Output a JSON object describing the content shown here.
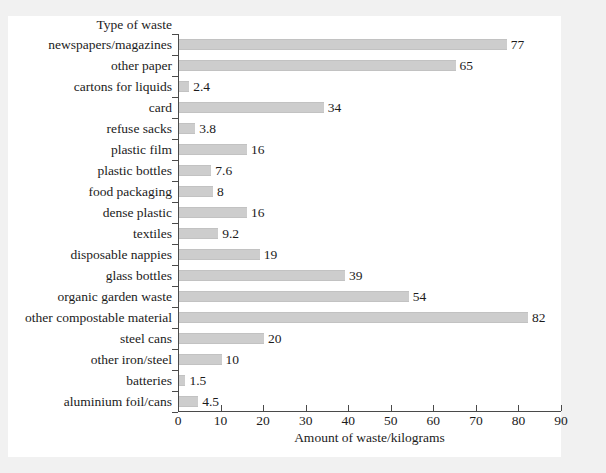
{
  "chart_data": {
    "type": "bar",
    "orientation": "horizontal",
    "title": "",
    "xlabel": "Amount of waste/kilograms",
    "ylabel": "Type of waste",
    "xlim": [
      0,
      90
    ],
    "xticks": [
      0,
      10,
      20,
      30,
      40,
      50,
      60,
      70,
      80,
      90
    ],
    "grid": false,
    "legend": null,
    "bar_color": "#cdcdcd",
    "categories": [
      "newspapers/magazines",
      "other paper",
      "cartons for liquids",
      "card",
      "refuse sacks",
      "plastic film",
      "plastic bottles",
      "food packaging",
      "dense plastic",
      "textiles",
      "disposable nappies",
      "glass bottles",
      "organic garden waste",
      "other compostable material",
      "steel cans",
      "other iron/steel",
      "batteries",
      "aluminium foil/cans"
    ],
    "values": [
      77,
      65,
      2.4,
      34,
      3.8,
      16,
      7.6,
      8,
      16,
      9.2,
      19,
      39,
      54,
      82,
      20,
      10,
      1.5,
      4.5
    ],
    "value_labels": [
      "77",
      "65",
      "2.4",
      "34",
      "3.8",
      "16",
      "7.6",
      "8",
      "16",
      "9.2",
      "19",
      "39",
      "54",
      "82",
      "20",
      "10",
      "1.5",
      "4.5"
    ]
  }
}
